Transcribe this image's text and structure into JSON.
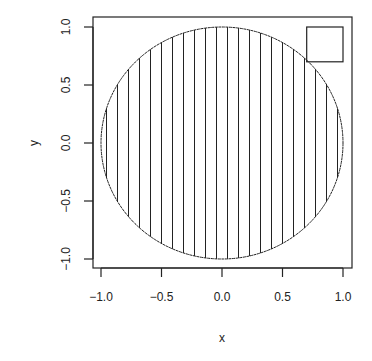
{
  "chart_data": {
    "type": "scatter",
    "title": "",
    "xlabel": "x",
    "ylabel": "y",
    "xlim": [
      -1.0,
      1.0
    ],
    "ylim": [
      -1.0,
      1.0
    ],
    "xticks": [
      -1.0,
      -0.5,
      0.0,
      0.5,
      1.0
    ],
    "xtick_labels": [
      "-1.0",
      "-0.5",
      "0.0",
      "0.5",
      "1.0"
    ],
    "yticks": [
      -1.0,
      -0.5,
      0.0,
      0.5,
      1.0
    ],
    "ytick_labels": [
      "-1.0",
      "-0.5",
      "0.0",
      "0.5",
      "1.0"
    ],
    "grid": false,
    "legend": null,
    "shapes": [
      {
        "kind": "circle",
        "center": [
          0,
          0
        ],
        "radius": 1.0,
        "fill": "vertical-hatch",
        "hatch_lines": 22
      },
      {
        "kind": "rectangle",
        "x0": 0.7,
        "y0": 0.7,
        "x1": 1.0,
        "y1": 1.0,
        "fill": "none"
      }
    ]
  },
  "style": {
    "line_color": "#222222",
    "background": "#ffffff"
  }
}
